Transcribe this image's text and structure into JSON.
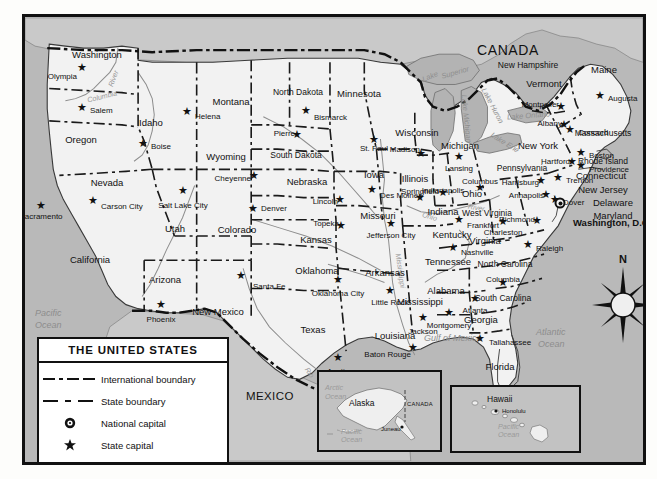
{
  "map": {
    "title": "Map of the United States",
    "colors": {
      "land_us": "#f2f2f2",
      "land_foreign": "#c9c9c9",
      "ocean": "#b9b9b9",
      "lake": "#b3b3b3",
      "border": "#111111",
      "water_label": "#8d8d8d"
    },
    "countries": [
      {
        "name": "CANADA",
        "x": 452,
        "y": 26,
        "size": "country"
      },
      {
        "name": "MEXICO",
        "x": 221,
        "y": 374,
        "size": "country-sm"
      }
    ],
    "oceans": [
      {
        "name": "Pacific",
        "x": 10,
        "y": 292
      },
      {
        "name": "Ocean",
        "x": 10,
        "y": 304
      },
      {
        "name": "Atlantic",
        "x": 511,
        "y": 311
      },
      {
        "name": "Ocean",
        "x": 513,
        "y": 323
      },
      {
        "name": "Gulf of Mexico",
        "x": 399,
        "y": 317
      }
    ],
    "lakes": [
      {
        "name": "Lake",
        "x": 397,
        "y": 56,
        "rot": -22
      },
      {
        "name": "Superior",
        "x": 416,
        "y": 52,
        "rot": -16
      },
      {
        "name": "Lake Michigan",
        "x": 417,
        "y": 98,
        "rot": 84
      },
      {
        "name": "Lake Huron",
        "x": 448,
        "y": 85,
        "rot": 62
      },
      {
        "name": "Lake Ontario",
        "x": 482,
        "y": 95,
        "rot": -4
      },
      {
        "name": "Lake Erie",
        "x": 464,
        "y": 122,
        "rot": 32
      }
    ],
    "rivers": [
      {
        "name": "Columbia",
        "x": 62,
        "y": 76,
        "rot": -14
      },
      {
        "name": "River",
        "x": 80,
        "y": 58,
        "rot": -70
      },
      {
        "name": "Mississippi",
        "x": 358,
        "y": 250,
        "rot": 82
      },
      {
        "name": "Ohio",
        "x": 397,
        "y": 196,
        "rot": 16
      },
      {
        "name": "River",
        "x": 443,
        "y": 187,
        "rot": 10
      },
      {
        "name": "Rio",
        "x": 279,
        "y": 352,
        "rot": 56
      },
      {
        "name": "Grande",
        "x": 290,
        "y": 366,
        "rot": 56
      }
    ],
    "states": [
      {
        "name": "Washington",
        "x": 72,
        "y": 33
      },
      {
        "name": "Oregon",
        "x": 56,
        "y": 118
      },
      {
        "name": "Idaho",
        "x": 126,
        "y": 101
      },
      {
        "name": "Montana",
        "x": 206,
        "y": 80
      },
      {
        "name": "Wyoming",
        "x": 201,
        "y": 135
      },
      {
        "name": "Nevada",
        "x": 82,
        "y": 161
      },
      {
        "name": "California",
        "x": 65,
        "y": 238
      },
      {
        "name": "Utah",
        "x": 150,
        "y": 207
      },
      {
        "name": "Arizona",
        "x": 140,
        "y": 258
      },
      {
        "name": "Colorado",
        "x": 212,
        "y": 208
      },
      {
        "name": "New Mexico",
        "x": 193,
        "y": 290
      },
      {
        "name": "North Dakota",
        "x": 273,
        "y": 71
      },
      {
        "name": "South Dakota",
        "x": 271,
        "y": 134
      },
      {
        "name": "Nebraska",
        "x": 282,
        "y": 160
      },
      {
        "name": "Kansas",
        "x": 291,
        "y": 218
      },
      {
        "name": "Oklahoma",
        "x": 292,
        "y": 249
      },
      {
        "name": "Texas",
        "x": 288,
        "y": 308
      },
      {
        "name": "Minnesota",
        "x": 334,
        "y": 72
      },
      {
        "name": "Iowa",
        "x": 349,
        "y": 153
      },
      {
        "name": "Missouri",
        "x": 353,
        "y": 194
      },
      {
        "name": "Arkansas",
        "x": 360,
        "y": 251
      },
      {
        "name": "Louisiana",
        "x": 370,
        "y": 314
      },
      {
        "name": "Wisconsin",
        "x": 392,
        "y": 111
      },
      {
        "name": "Illinois",
        "x": 390,
        "y": 157
      },
      {
        "name": "Michigan",
        "x": 435,
        "y": 124
      },
      {
        "name": "Indiana",
        "x": 418,
        "y": 190
      },
      {
        "name": "Ohio",
        "x": 447,
        "y": 172
      },
      {
        "name": "Kentucky",
        "x": 427,
        "y": 213
      },
      {
        "name": "Tennessee",
        "x": 423,
        "y": 240
      },
      {
        "name": "Mississippi",
        "x": 395,
        "y": 280
      },
      {
        "name": "Alabama",
        "x": 421,
        "y": 269
      },
      {
        "name": "Georgia",
        "x": 456,
        "y": 298
      },
      {
        "name": "Florida",
        "x": 475,
        "y": 345
      },
      {
        "name": "South Carolina",
        "x": 478,
        "y": 277
      },
      {
        "name": "North Carolina",
        "x": 480,
        "y": 243
      },
      {
        "name": "Virginia",
        "x": 460,
        "y": 219
      },
      {
        "name": "West Virginia",
        "x": 462,
        "y": 192
      },
      {
        "name": "Pennsylvania",
        "x": 497,
        "y": 147
      },
      {
        "name": "New York",
        "x": 513,
        "y": 124
      },
      {
        "name": "Maryland",
        "x": 588,
        "y": 194
      },
      {
        "name": "Delaware",
        "x": 588,
        "y": 181
      },
      {
        "name": "New Jersey",
        "x": 578,
        "y": 168
      },
      {
        "name": "Connecticut",
        "x": 576,
        "y": 154
      },
      {
        "name": "Rhode Island",
        "x": 578,
        "y": 140
      },
      {
        "name": "Massachusetts",
        "x": 578,
        "y": 112
      },
      {
        "name": "Vermont",
        "x": 519,
        "y": 62
      },
      {
        "name": "New Hampshire",
        "x": 503,
        "y": 44
      },
      {
        "name": "Maine",
        "x": 579,
        "y": 48
      }
    ],
    "capitals": [
      {
        "name": "Olympia",
        "sx": 57,
        "sy": 50,
        "lx": 46,
        "ly": 56,
        "anchor": "end"
      },
      {
        "name": "Salem",
        "sx": 57,
        "sy": 90,
        "lx": 65,
        "ly": 90,
        "anchor": "start"
      },
      {
        "name": "Boise",
        "sx": 118,
        "sy": 126,
        "lx": 126,
        "ly": 126,
        "anchor": "start"
      },
      {
        "name": "Helena",
        "sx": 162,
        "sy": 94,
        "lx": 170,
        "ly": 96,
        "anchor": "start"
      },
      {
        "name": "Sacramento",
        "sx": 16,
        "sy": 188,
        "lx": 16,
        "ly": 196,
        "anchor": "mid"
      },
      {
        "name": "Carson City",
        "sx": 68,
        "sy": 183,
        "lx": 76,
        "ly": 186,
        "anchor": "start"
      },
      {
        "name": "Salt Lake City",
        "sx": 158,
        "sy": 173,
        "lx": 158,
        "ly": 185,
        "anchor": "mid"
      },
      {
        "name": "Phoenix",
        "sx": 136,
        "sy": 287,
        "lx": 136,
        "ly": 299,
        "anchor": "mid"
      },
      {
        "name": "Santa Fe",
        "sx": 216,
        "sy": 258,
        "lx": 228,
        "ly": 266,
        "anchor": "start"
      },
      {
        "name": "Cheyenne",
        "sx": 229,
        "sy": 158,
        "lx": 220,
        "ly": 158,
        "anchor": "end"
      },
      {
        "name": "Denver",
        "sx": 228,
        "sy": 191,
        "lx": 236,
        "ly": 188,
        "anchor": "start"
      },
      {
        "name": "Bismarck",
        "sx": 281,
        "sy": 93,
        "lx": 289,
        "ly": 97,
        "anchor": "start"
      },
      {
        "name": "Pierre",
        "sx": 272,
        "sy": 117,
        "lx": 264,
        "ly": 113,
        "anchor": "end"
      },
      {
        "name": "Lincoln",
        "sx": 315,
        "sy": 182,
        "lx": 307,
        "ly": 181,
        "anchor": "end"
      },
      {
        "name": "Topeka",
        "sx": 316,
        "sy": 208,
        "lx": 308,
        "ly": 203,
        "anchor": "end"
      },
      {
        "name": "Oklahoma City",
        "sx": 313,
        "sy": 262,
        "lx": 313,
        "ly": 273,
        "anchor": "mid"
      },
      {
        "name": "Austin",
        "sx": 313,
        "sy": 340,
        "lx": 313,
        "ly": 351,
        "anchor": "mid"
      },
      {
        "name": "St. Paul",
        "sx": 349,
        "sy": 122,
        "lx": 349,
        "ly": 128,
        "anchor": "mid"
      },
      {
        "name": "Des Moines",
        "sx": 347,
        "sy": 172,
        "lx": 355,
        "ly": 175,
        "anchor": "start"
      },
      {
        "name": "Jefferson City",
        "sx": 366,
        "sy": 206,
        "lx": 366,
        "ly": 215,
        "anchor": "mid"
      },
      {
        "name": "Little Rock",
        "sx": 365,
        "sy": 273,
        "lx": 365,
        "ly": 282,
        "anchor": "mid"
      },
      {
        "name": "Baton Rouge",
        "sx": 388,
        "sy": 330,
        "lx": 380,
        "ly": 334,
        "anchor": "end"
      },
      {
        "name": "Jackson",
        "sx": 398,
        "sy": 300,
        "lx": 398,
        "ly": 311,
        "anchor": "mid"
      },
      {
        "name": "Madison",
        "sx": 396,
        "sy": 136,
        "lx": 389,
        "ly": 129,
        "anchor": "end"
      },
      {
        "name": "Springfield",
        "sx": 395,
        "sy": 180,
        "lx": 395,
        "ly": 171,
        "anchor": "mid"
      },
      {
        "name": "Lansing",
        "sx": 434,
        "sy": 139,
        "lx": 434,
        "ly": 148,
        "anchor": "mid"
      },
      {
        "name": "Indianapolis",
        "sx": 418,
        "sy": 175,
        "lx": 418,
        "ly": 170,
        "anchor": "mid"
      },
      {
        "name": "Columbus",
        "sx": 455,
        "sy": 170,
        "lx": 455,
        "ly": 161,
        "anchor": "mid"
      },
      {
        "name": "Frankfort",
        "sx": 434,
        "sy": 202,
        "lx": 442,
        "ly": 205,
        "anchor": "start"
      },
      {
        "name": "Nashville",
        "sx": 428,
        "sy": 230,
        "lx": 436,
        "ly": 232,
        "anchor": "start"
      },
      {
        "name": "Montgomery",
        "sx": 424,
        "sy": 295,
        "lx": 424,
        "ly": 305,
        "anchor": "mid"
      },
      {
        "name": "Atlanta",
        "sx": 450,
        "sy": 281,
        "lx": 450,
        "ly": 290,
        "anchor": "mid"
      },
      {
        "name": "Tallahassee",
        "sx": 455,
        "sy": 321,
        "lx": 464,
        "ly": 322,
        "anchor": "start"
      },
      {
        "name": "Columbia",
        "sx": 478,
        "sy": 265,
        "lx": 478,
        "ly": 259,
        "anchor": "mid"
      },
      {
        "name": "Raleigh",
        "sx": 503,
        "sy": 227,
        "lx": 511,
        "ly": 228,
        "anchor": "start"
      },
      {
        "name": "Richmond",
        "sx": 512,
        "sy": 203,
        "lx": 504,
        "ly": 199,
        "anchor": "end"
      },
      {
        "name": "Charleston",
        "sx": 478,
        "sy": 204,
        "lx": 478,
        "ly": 212,
        "anchor": "mid"
      },
      {
        "name": "Annapolis",
        "sx": 521,
        "sy": 177,
        "lx": 513,
        "ly": 175,
        "anchor": "end"
      },
      {
        "name": "Dover",
        "sx": 530,
        "sy": 182,
        "lx": 538,
        "ly": 182,
        "anchor": "start"
      },
      {
        "name": "Harrisburg",
        "sx": 516,
        "sy": 163,
        "lx": 508,
        "ly": 162,
        "anchor": "end"
      },
      {
        "name": "Trenton",
        "sx": 533,
        "sy": 160,
        "lx": 541,
        "ly": 160,
        "anchor": "start"
      },
      {
        "name": "Hartford",
        "sx": 547,
        "sy": 144,
        "lx": 539,
        "ly": 141,
        "anchor": "end"
      },
      {
        "name": "Providence",
        "sx": 556,
        "sy": 148,
        "lx": 564,
        "ly": 149,
        "anchor": "start"
      },
      {
        "name": "Boston",
        "sx": 556,
        "sy": 135,
        "lx": 564,
        "ly": 135,
        "anchor": "start"
      },
      {
        "name": "Concord",
        "sx": 545,
        "sy": 112,
        "lx": 553,
        "ly": 112,
        "anchor": "start"
      },
      {
        "name": "Montpelier",
        "sx": 536,
        "sy": 89,
        "lx": 528,
        "ly": 84,
        "anchor": "end"
      },
      {
        "name": "Albany",
        "sx": 539,
        "sy": 107,
        "lx": 531,
        "ly": 103,
        "anchor": "end"
      },
      {
        "name": "Augusta",
        "sx": 575,
        "sy": 78,
        "lx": 583,
        "ly": 78,
        "anchor": "start"
      }
    ],
    "national_capital": {
      "name": "Washington, D.C.",
      "sx": 535,
      "sy": 186,
      "lx": 548,
      "ly": 201
    }
  },
  "legend": {
    "title": "THE UNITED STATES",
    "rows": [
      {
        "symbol": "international-boundary",
        "label": "International boundary"
      },
      {
        "symbol": "state-boundary",
        "label": "State boundary"
      },
      {
        "symbol": "national-capital",
        "label": "National capital"
      },
      {
        "symbol": "state-capital",
        "label": "State capital"
      }
    ]
  },
  "insets": {
    "alaska": {
      "region": "Alaska",
      "capital": "Juneau",
      "neighbor": "CANADA",
      "oceans": [
        "Arctic",
        "Ocean",
        "Pacific",
        "Ocean"
      ]
    },
    "hawaii": {
      "region": "Hawaii",
      "capital": "Honolulu",
      "oceans": [
        "Pacific",
        "Ocean"
      ]
    }
  },
  "compass": {
    "north_label": "N"
  }
}
